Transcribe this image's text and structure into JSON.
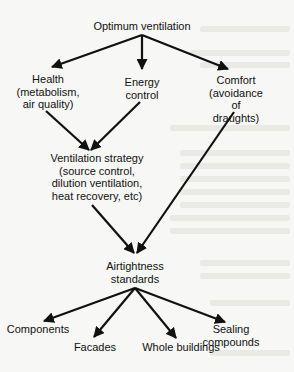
{
  "diagram": {
    "title": "Optimum ventilation",
    "nodes": [
      {
        "id": "optimum",
        "label": "Optimum ventilation"
      },
      {
        "id": "health",
        "label": "Health\n(metabolism,\nair quality)"
      },
      {
        "id": "energy",
        "label": "Energy\ncontrol"
      },
      {
        "id": "comfort",
        "label": "Comfort\n(avoidance of\ndraughts)"
      },
      {
        "id": "strategy",
        "label": "Ventilation strategy\n(source control,\ndilution ventilation,\nheat recovery, etc)"
      },
      {
        "id": "airtightness",
        "label": "Airtightness\nstandards"
      },
      {
        "id": "components",
        "label": "Components"
      },
      {
        "id": "facades",
        "label": "Facades"
      },
      {
        "id": "whole",
        "label": "Whole buildings"
      },
      {
        "id": "sealing",
        "label": "Sealing compounds"
      }
    ],
    "edges": [
      {
        "from": "optimum",
        "to": "health"
      },
      {
        "from": "optimum",
        "to": "energy"
      },
      {
        "from": "optimum",
        "to": "comfort"
      },
      {
        "from": "health",
        "to": "strategy"
      },
      {
        "from": "energy",
        "to": "strategy"
      },
      {
        "from": "strategy",
        "to": "airtightness"
      },
      {
        "from": "comfort",
        "to": "airtightness"
      },
      {
        "from": "airtightness",
        "to": "components"
      },
      {
        "from": "airtightness",
        "to": "facades"
      },
      {
        "from": "airtightness",
        "to": "whole"
      },
      {
        "from": "airtightness",
        "to": "sealing"
      }
    ]
  }
}
